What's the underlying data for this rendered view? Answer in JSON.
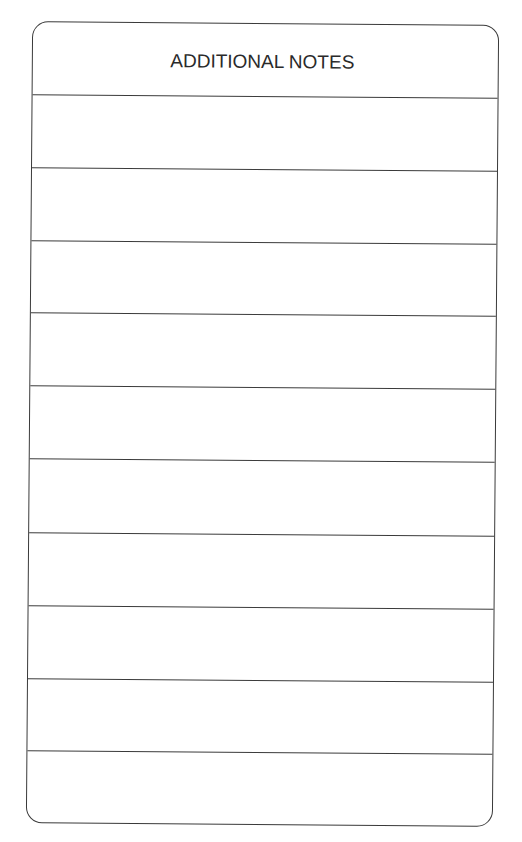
{
  "form": {
    "title": "ADDITIONAL NOTES",
    "line_count": 10,
    "lines": [
      {
        "index": 1,
        "value": ""
      },
      {
        "index": 2,
        "value": ""
      },
      {
        "index": 3,
        "value": ""
      },
      {
        "index": 4,
        "value": ""
      },
      {
        "index": 5,
        "value": ""
      },
      {
        "index": 6,
        "value": ""
      },
      {
        "index": 7,
        "value": ""
      },
      {
        "index": 8,
        "value": ""
      },
      {
        "index": 9,
        "value": ""
      },
      {
        "index": 10,
        "value": ""
      }
    ]
  },
  "colors": {
    "ink": "#3a3a3a",
    "paper": "#ffffff"
  }
}
